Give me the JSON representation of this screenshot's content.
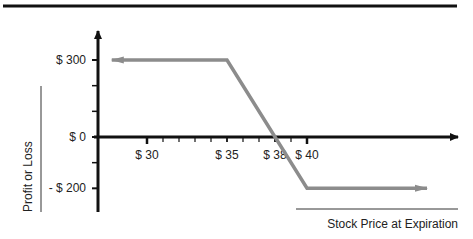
{
  "chart_data": {
    "type": "line",
    "title": "",
    "xlabel": "Stock Price at Expiration",
    "ylabel": "Profit or Loss",
    "x_ticks": [
      {
        "value": 30,
        "label": "$ 30"
      },
      {
        "value": 35,
        "label": "$ 35"
      },
      {
        "value": 38,
        "label": "$ 38"
      },
      {
        "value": 40,
        "label": "$ 40"
      }
    ],
    "x_minor_tick_step": 1,
    "y_ticks": [
      {
        "value": 300,
        "label": "$ 300"
      },
      {
        "value": 0,
        "label": "$ 0"
      },
      {
        "value": -200,
        "label": "- $ 200"
      }
    ],
    "y_minor_ticks": [
      100,
      200,
      -100
    ],
    "xlim": [
      26.8,
      48.5
    ],
    "ylim": [
      -280,
      420
    ],
    "series": [
      {
        "name": "Payoff",
        "color": "#8c8c8c",
        "arrow_left": true,
        "arrow_right": true,
        "x": [
          27.8,
          35,
          40,
          47.5
        ],
        "y": [
          300,
          300,
          -200,
          -200
        ]
      }
    ],
    "grid": false,
    "legend": "none",
    "colors": {
      "axis": "#111111",
      "payoff_line": "#8c8c8c",
      "rule": "#111111"
    }
  }
}
